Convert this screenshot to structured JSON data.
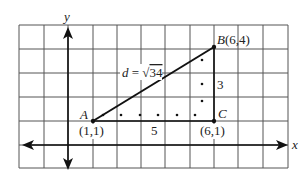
{
  "figure": {
    "axes": {
      "x_label": "x",
      "y_label": "y"
    },
    "points": {
      "A": {
        "name": "A",
        "coords": "(1,1)"
      },
      "B": {
        "name": "B",
        "coords": "(6,4)"
      },
      "C": {
        "name": "C",
        "coords": "(6,1)"
      }
    },
    "labels": {
      "distance": "d = √34",
      "distance_prefix": "d",
      "distance_equals": " = ",
      "distance_radical": "√",
      "distance_radicand": "34",
      "horizontal_leg": "5",
      "vertical_leg": "3",
      "B_label": "B",
      "B_coords": "(6,4)",
      "A_label": "A",
      "A_coords": "(1,1)",
      "C_label": "C",
      "C_coords": "(6,1)"
    },
    "colors": {
      "grid": "#444444",
      "ink": "#111111",
      "background": "#ffffff"
    }
  }
}
